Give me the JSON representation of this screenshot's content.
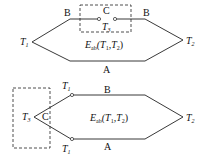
{
  "diagram1": {
    "junction_left": {
      "label": "T",
      "sub": "1"
    },
    "junction_right": {
      "label": "T",
      "sub": "2"
    },
    "wire_top": "B",
    "wire_bottom": "A",
    "inserted_conductor": "C",
    "inserted_temp": {
      "label": "T",
      "sub": "3"
    },
    "emf": {
      "label": "E",
      "sub": "ab",
      "args": "(T",
      "arg1_sub": "1",
      "sep": ",T",
      "arg2_sub": "2",
      "close": ")"
    }
  },
  "diagram2": {
    "junction_top": {
      "label": "T",
      "sub": "1"
    },
    "junction_bottom": {
      "label": "T",
      "sub": "1"
    },
    "junction_right": {
      "label": "T",
      "sub": "2"
    },
    "junction_left": {
      "label": "T",
      "sub": "3"
    },
    "wire_top": "B",
    "wire_bottom": "A",
    "inserted_conductor": "C",
    "emf": {
      "label": "E",
      "sub": "ab",
      "args": "(T",
      "arg1_sub": "1",
      "sep": ",T",
      "arg2_sub": "2",
      "close": ")"
    }
  },
  "colors": {
    "line": "#222222",
    "background": "#ffffff"
  }
}
